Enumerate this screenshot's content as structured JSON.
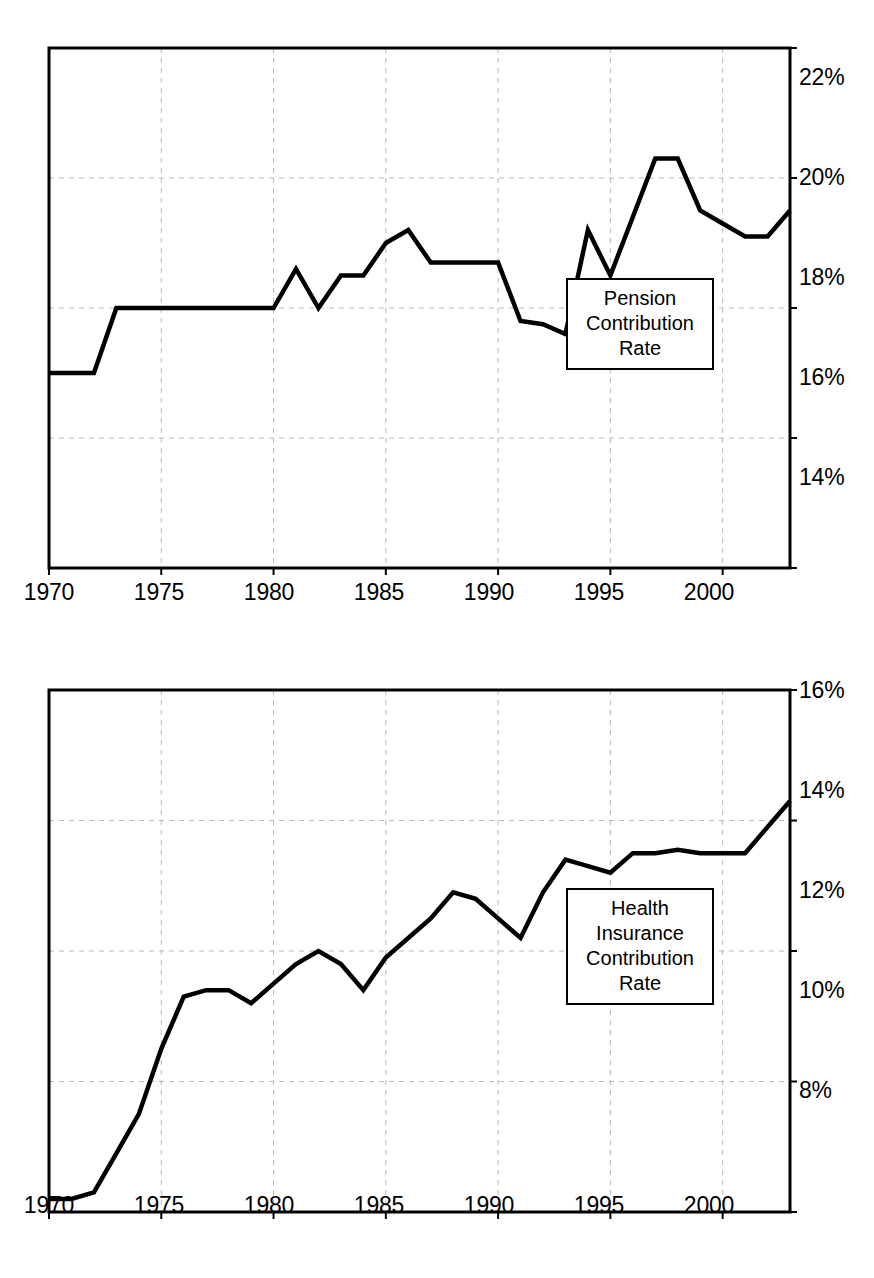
{
  "page": {
    "top_caption": ""
  },
  "charts": [
    {
      "id": "pension",
      "legend": {
        "lines": [
          "Pension",
          "Contribution",
          "Rate"
        ]
      },
      "yticks": [
        "22%",
        "20%",
        "18%",
        "16%",
        "14%"
      ],
      "xticks": [
        "1970",
        "1975",
        "1980",
        "1985",
        "1990",
        "1995",
        "2000"
      ]
    },
    {
      "id": "health",
      "legend": {
        "lines": [
          "Health",
          "Insurance",
          "Contribution",
          "Rate"
        ]
      },
      "yticks": [
        "16%",
        "14%",
        "12%",
        "10%",
        "8%"
      ],
      "xticks": [
        "1970",
        "1975",
        "1980",
        "1985",
        "1990",
        "1995",
        "2000"
      ]
    }
  ],
  "chart_data": [
    {
      "type": "line",
      "title": "Pension Contribution Rate",
      "xlabel": "",
      "ylabel": "",
      "xlim": [
        1970,
        2003
      ],
      "ylim": [
        14,
        22
      ],
      "yticks": [
        14,
        16,
        18,
        20,
        22
      ],
      "xticks": [
        1970,
        1975,
        1980,
        1985,
        1990,
        1995,
        2000
      ],
      "ytick_labels": [
        "14%",
        "16%",
        "18%",
        "20%",
        "22%"
      ],
      "grid": "dashed-both",
      "legend_position": "inside-right",
      "series": [
        {
          "name": "Pension Contribution Rate",
          "x": [
            1970,
            1971,
            1972,
            1973,
            1974,
            1975,
            1976,
            1977,
            1978,
            1979,
            1980,
            1981,
            1982,
            1983,
            1984,
            1985,
            1986,
            1987,
            1988,
            1989,
            1990,
            1991,
            1992,
            1993,
            1994,
            1995,
            1996,
            1997,
            1998,
            1999,
            2000,
            2001,
            2002,
            2003
          ],
          "values": [
            17.0,
            17.0,
            17.0,
            18.0,
            18.0,
            18.0,
            18.0,
            18.0,
            18.0,
            18.0,
            18.0,
            18.6,
            18.0,
            18.5,
            18.5,
            19.0,
            19.2,
            18.7,
            18.7,
            18.7,
            18.7,
            17.8,
            17.75,
            17.6,
            19.2,
            18.5,
            19.4,
            20.3,
            20.3,
            19.5,
            19.3,
            19.1,
            19.1,
            19.5
          ]
        }
      ]
    },
    {
      "type": "line",
      "title": "Health Insurance Contribution Rate",
      "xlabel": "",
      "ylabel": "",
      "xlim": [
        1970,
        2003
      ],
      "ylim": [
        8,
        16
      ],
      "yticks": [
        8,
        10,
        12,
        14,
        16
      ],
      "xticks": [
        1970,
        1975,
        1980,
        1985,
        1990,
        1995,
        2000
      ],
      "ytick_labels": [
        "8%",
        "10%",
        "12%",
        "14%",
        "16%"
      ],
      "grid": "dashed-both",
      "legend_position": "inside-right",
      "series": [
        {
          "name": "Health Insurance Contribution Rate",
          "x": [
            1970,
            1971,
            1972,
            1973,
            1974,
            1975,
            1976,
            1977,
            1978,
            1979,
            1980,
            1981,
            1982,
            1983,
            1984,
            1985,
            1986,
            1987,
            1988,
            1989,
            1990,
            1991,
            1992,
            1993,
            1994,
            1995,
            1996,
            1997,
            1998,
            1999,
            2000,
            2001,
            2002,
            2003
          ],
          "values": [
            8.2,
            8.2,
            8.3,
            8.9,
            9.5,
            10.5,
            11.3,
            11.4,
            11.4,
            11.2,
            11.5,
            11.8,
            12.0,
            11.8,
            11.4,
            11.9,
            12.2,
            12.5,
            12.9,
            12.8,
            12.5,
            12.2,
            12.9,
            13.4,
            13.3,
            13.2,
            13.5,
            13.5,
            13.55,
            13.5,
            13.5,
            13.5,
            13.9,
            14.3
          ]
        }
      ]
    }
  ]
}
